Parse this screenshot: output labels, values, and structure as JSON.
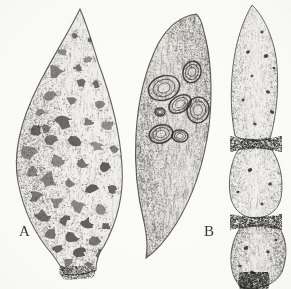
{
  "figure": {
    "kind": "scientific-illustration",
    "medium": "pen-and-ink stipple drawing, grayscale halftone",
    "background_color": "#fbfbfa",
    "ink_color": "#2b2b29",
    "width": 291,
    "height": 289
  },
  "labels": [
    {
      "id": "A",
      "text": "A",
      "x": 19,
      "y": 224,
      "refers_to": "left-specimen"
    },
    {
      "id": "B",
      "text": "B",
      "x": 204,
      "y": 224,
      "refers_to": "middle-specimen"
    }
  ],
  "specimens": [
    {
      "id": "left-specimen",
      "label": "A",
      "position": "left",
      "description": "Broad teardrop / tapered root with a long pointed apex at top, swollen body, and a short blunt stub at the base. Heavy dark shading along the left margin.",
      "symptom": "numerous irregular dark sunken blotches scattered over the surface",
      "lesion_style": "irregular-blotches",
      "bounds": {
        "x": 14,
        "y": 8,
        "w": 110,
        "h": 268
      },
      "shading_side": "left",
      "lesion_count": 46
    },
    {
      "id": "middle-specimen",
      "label": "B",
      "position": "center",
      "description": "Curved crescent-shaped root, broad at the top and tapering to a sharp point at the lower left; longitudinal fibrous striations across the surface.",
      "symptom": "several large concentric ring-shaped raised scabby lesions clustered on the upper half",
      "lesion_style": "concentric-rings",
      "bounds": {
        "x": 134,
        "y": 12,
        "w": 78,
        "h": 248
      },
      "shading_side": "right",
      "lesion_count": 7
    },
    {
      "id": "right-specimen",
      "label": "",
      "position": "right",
      "description": "Elongated root strongly constricted into three swollen segments separated by dark narrow waists, ending in a short dark stem at the base; pointed apex at top.",
      "symptom": "small discrete dark pits and punctures distributed over each segment",
      "lesion_style": "small-dark-pits",
      "bounds": {
        "x": 228,
        "y": 4,
        "w": 62,
        "h": 285
      },
      "shading_side": "both",
      "segments": 3,
      "lesion_count": 16
    }
  ],
  "render": {
    "stipple_seed": 20240517,
    "stipple_density": 0.55,
    "edge_line_width": 1.0
  }
}
